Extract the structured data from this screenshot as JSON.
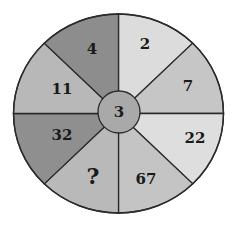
{
  "puzzle": {
    "center": {
      "value": "3",
      "color": "#a9a9a9"
    },
    "segments": [
      {
        "id": "top-right",
        "value": "2",
        "color": "#dcdcdc",
        "angle_start": -90,
        "angle_end": -45,
        "tx": 145,
        "ty": 44
      },
      {
        "id": "right-upper",
        "value": "7",
        "color": "#c6c6c6",
        "angle_start": -45,
        "angle_end": 0,
        "tx": 188,
        "ty": 86
      },
      {
        "id": "right-lower",
        "value": "22",
        "color": "#dedede",
        "angle_start": 0,
        "angle_end": 45,
        "tx": 195,
        "ty": 138
      },
      {
        "id": "bottom-right",
        "value": "67",
        "color": "#c4c4c4",
        "angle_start": 45,
        "angle_end": 90,
        "tx": 146,
        "ty": 179
      },
      {
        "id": "bottom-left",
        "value": "?",
        "color": "#b9b9b9",
        "angle_start": 90,
        "angle_end": 135,
        "tx": 93,
        "ty": 176
      },
      {
        "id": "left-lower",
        "value": "32",
        "color": "#8f8f8f",
        "angle_start": 135,
        "angle_end": 180,
        "tx": 62,
        "ty": 135
      },
      {
        "id": "left-upper",
        "value": "11",
        "color": "#b8b8b8",
        "angle_start": 180,
        "angle_end": 225,
        "tx": 62,
        "ty": 89
      },
      {
        "id": "top-left",
        "value": "4",
        "color": "#8d8d8d",
        "angle_start": 225,
        "angle_end": 270,
        "tx": 92,
        "ty": 49
      }
    ]
  }
}
